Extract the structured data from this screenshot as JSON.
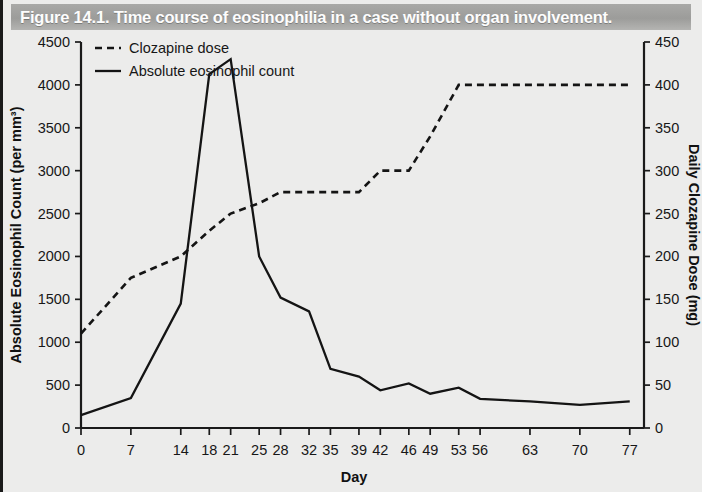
{
  "figure": {
    "number": "Figure 14.1.",
    "caption": "Time course of eosinophilia in a case without organ involvement.",
    "full_title": "Figure 14.1.  Time course of eosinophilia in a case without organ involvement."
  },
  "colors": {
    "banner_background": "#a6a6a4",
    "banner_text": "#fdfdfd",
    "page_background": "#ececeb",
    "ink": "#141414"
  },
  "chart_data": {
    "type": "line",
    "title": "Time course of eosinophilia in a case without organ involvement.",
    "xlabel": "Day",
    "ylabel": "Absolute Eosinophil Count (per mm³)",
    "y2label": "Daily Clozapine Dose (mg)",
    "xlim": [
      0,
      79
    ],
    "ylim": [
      0,
      4500
    ],
    "y2lim": [
      0,
      450
    ],
    "grid": false,
    "legend_position": "top-left",
    "xticks": [
      0,
      7,
      14,
      18,
      21,
      25,
      28,
      32,
      35,
      39,
      42,
      46,
      49,
      53,
      56,
      63,
      70,
      77
    ],
    "xticklabels": [
      "0",
      "7",
      "14",
      "18",
      "21",
      "25",
      "28",
      "32",
      "35",
      "39",
      "42",
      "46",
      "49",
      "53",
      "56",
      "63",
      "70",
      "77"
    ],
    "yticks": [
      0,
      500,
      1000,
      1500,
      2000,
      2500,
      3000,
      3500,
      4000,
      4500
    ],
    "yticklabels": [
      "0",
      "500",
      "1000",
      "1500",
      "2000",
      "2500",
      "3000",
      "3500",
      "4000",
      "4500"
    ],
    "y2ticks": [
      0,
      50,
      100,
      150,
      200,
      250,
      300,
      350,
      400,
      450
    ],
    "y2ticklabels": [
      "0",
      "50",
      "100",
      "150",
      "200",
      "250",
      "300",
      "350",
      "400",
      "450"
    ],
    "series": [
      {
        "name": "Clozapine dose",
        "style": "dashed",
        "axis": "right",
        "units": "mg",
        "x": [
          0,
          7,
          14,
          18,
          21,
          25,
          28,
          32,
          35,
          39,
          42,
          46,
          49,
          53,
          56,
          63,
          70,
          77
        ],
        "values": [
          110,
          175,
          200,
          230,
          250,
          262,
          275,
          275,
          275,
          275,
          300,
          300,
          340,
          400,
          400,
          400,
          400,
          400
        ]
      },
      {
        "name": "Absolute eosinophil count",
        "style": "solid",
        "axis": "left",
        "units": "per mm3",
        "x": [
          0,
          7,
          14,
          18,
          21,
          25,
          28,
          32,
          35,
          39,
          42,
          46,
          49,
          53,
          56,
          63,
          70,
          77
        ],
        "values": [
          150,
          350,
          1450,
          4125,
          4300,
          2000,
          1520,
          1360,
          690,
          600,
          440,
          520,
          400,
          470,
          340,
          310,
          270,
          310
        ]
      }
    ]
  },
  "legend": {
    "entries": [
      {
        "label": "Clozapine dose",
        "style": "dashed"
      },
      {
        "label": "Absolute eosinophil count",
        "style": "solid"
      }
    ]
  }
}
